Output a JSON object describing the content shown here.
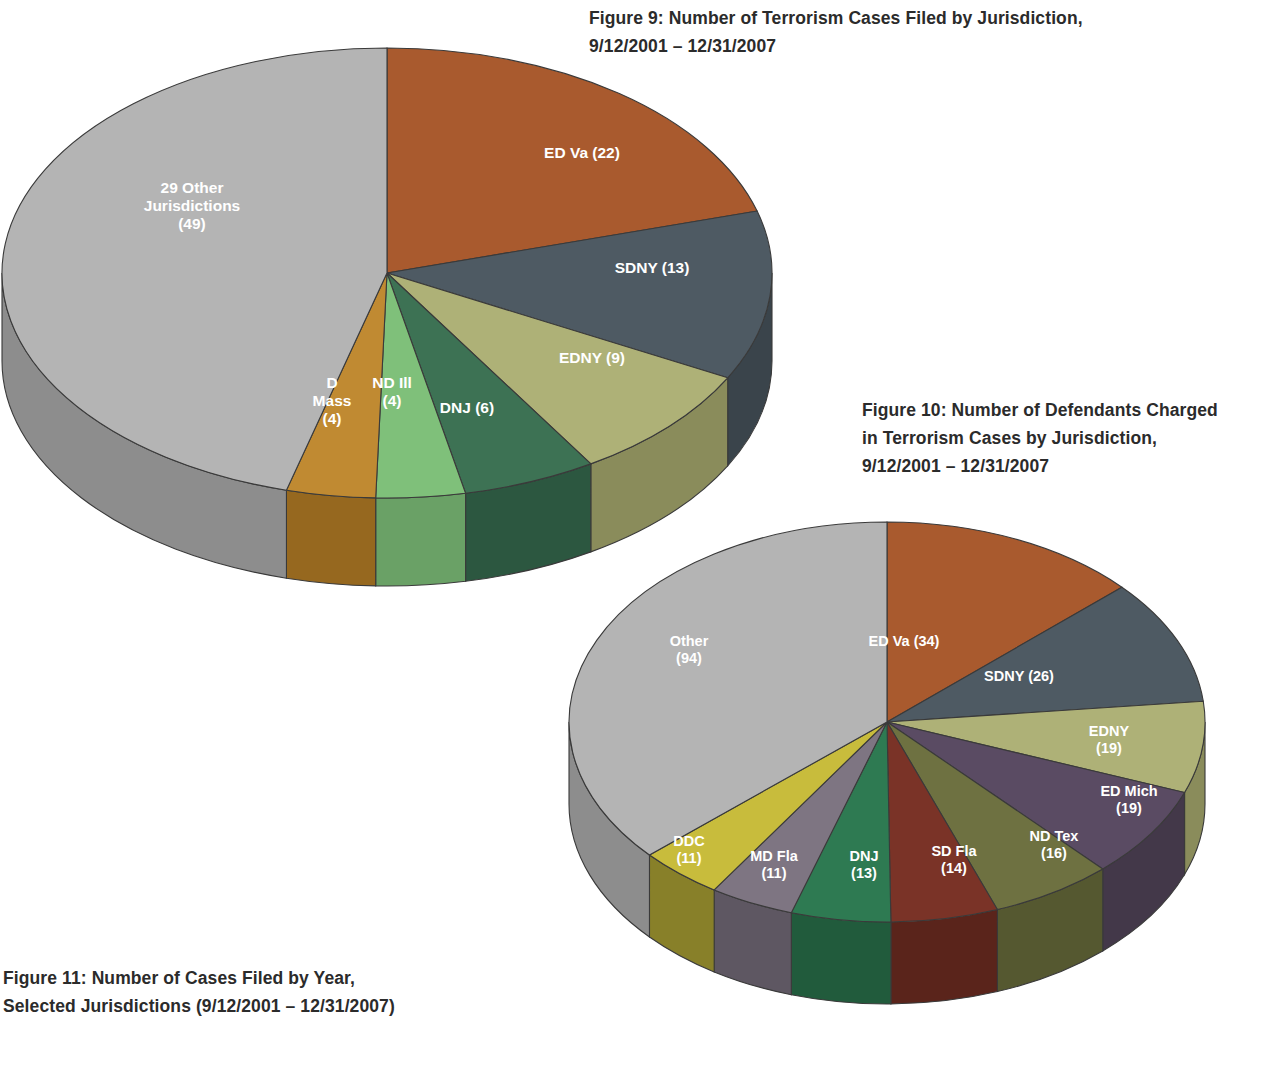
{
  "page": {
    "background": "#ffffff",
    "text_color": "#2b2b2b"
  },
  "captions": {
    "figure9": "Figure 9: Number of Terrorism Cases Filed by Jurisdiction,\n9/12/2001 – 12/31/2007",
    "figure10": "Figure 10: Number of Defendants Charged\nin Terrorism Cases by Jurisdiction,\n9/12/2001 – 12/31/2007",
    "figure11": "Figure 11: Number of Cases Filed by Year,\nSelected Jurisdictions (9/12/2001 – 12/31/2007)"
  },
  "chart_data": [
    {
      "id": "figure9",
      "type": "pie",
      "title": "Figure 9: Number of Terrorism Cases Filed by Jurisdiction, 9/12/2001 – 12/31/2007",
      "three_d": true,
      "start_angle_deg": -90,
      "direction": "clockwise",
      "total": 107,
      "categories": [
        "ED Va",
        "SDNY",
        "EDNY",
        "DNJ",
        "ND Ill",
        "D Mass",
        "29 Other Jurisdictions"
      ],
      "values": [
        22,
        13,
        9,
        6,
        4,
        4,
        49
      ],
      "labels": [
        "ED Va (22)",
        "SDNY (13)",
        "EDNY (9)",
        "DNJ (6)",
        "ND Ill\n(4)",
        "D\nMass\n(4)",
        "29 Other\nJurisdictions\n(49)"
      ],
      "colors": [
        "#a95a2e",
        "#4e5a63",
        "#aeb177",
        "#3d7254",
        "#7fc07a",
        "#c08a32",
        "#b4b4b4"
      ],
      "side_colors": [
        "#7a3f20",
        "#3a444b",
        "#8a8c5b",
        "#2c5740",
        "#6aa166",
        "#96681f",
        "#8d8d8d"
      ],
      "legend": "none",
      "labels_inside": true
    },
    {
      "id": "figure10",
      "type": "pie",
      "title": "Figure 10: Number of Defendants Charged in Terrorism Cases by Jurisdiction, 9/12/2001 – 12/31/2007",
      "three_d": true,
      "start_angle_deg": -90,
      "direction": "clockwise",
      "total": 277,
      "categories": [
        "ED Va",
        "SDNY",
        "EDNY",
        "ED Mich",
        "ND Tex",
        "SD Fla",
        "DNJ",
        "MD Fla",
        "DDC",
        "Other"
      ],
      "values": [
        34,
        26,
        19,
        19,
        16,
        14,
        13,
        11,
        11,
        94
      ],
      "labels": [
        "ED Va (34)",
        "SDNY (26)",
        "EDNY\n(19)",
        "ED Mich\n(19)",
        "ND Tex\n(16)",
        "SD Fla\n(14)",
        "DNJ\n(13)",
        "MD Fla\n(11)",
        "DDC\n(11)",
        "Other\n(94)"
      ],
      "colors": [
        "#a95a2e",
        "#4e5a63",
        "#aeb177",
        "#5a4b63",
        "#6e7141",
        "#7a3327",
        "#2e7a52",
        "#7e7582",
        "#c8bc3c",
        "#b4b4b4"
      ],
      "side_colors": [
        "#7a3f20",
        "#3a444b",
        "#8a8c5b",
        "#433849",
        "#555830",
        "#5a241b",
        "#215b3c",
        "#5e5762",
        "#97८d2c",
        "#8d8d8d"
      ],
      "legend": "none",
      "labels_inside": true
    }
  ]
}
